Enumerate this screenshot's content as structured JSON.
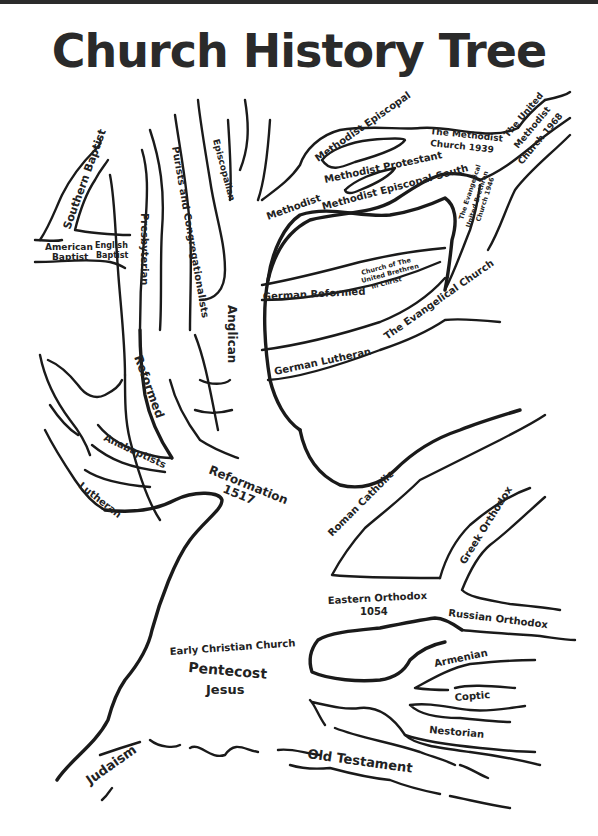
{
  "title": "Church History Tree",
  "colors": {
    "ink": "#1a1a1a",
    "text": "#222222",
    "background": "#ffffff"
  },
  "labels": {
    "southern_baptist": "Southern Baptist",
    "american_baptist_1": "American",
    "american_baptist_2": "Baptist",
    "english_baptist_1": "English",
    "english_baptist_2": "Baptist",
    "presbyterian": "Presbyterian",
    "purists": "Purists and Congregationalists",
    "episcopalian": "Episcopalian",
    "methodist": "Methodist",
    "methodist_episcopal": "Methodist Episcopal",
    "methodist_protestant": "Methodist Protestant",
    "methodist_episcopal_south": "Methodist Episcopal-South",
    "methodist_church_1": "The Methodist",
    "methodist_church_2": "Church 1939",
    "united_methodist_1": "The United",
    "united_methodist_2": "Methodist",
    "united_methodist_3": "Church 1968",
    "evangelical_ub_1": "The Evangelical",
    "evangelical_ub_2": "United Brethren",
    "evangelical_ub_3": "Church 1946",
    "german_reformed": "German Reformed",
    "united_brethren_1": "Church of The",
    "united_brethren_2": "United Brethren",
    "united_brethren_3": "In Christ",
    "evangelical_church": "The Evangelical Church",
    "german_lutheran": "German Lutheran",
    "anglican": "Anglican",
    "reformed": "Reformed",
    "anabaptists": "Anabaptists",
    "lutheran": "Lutheran",
    "reformation_1": "Reformation",
    "reformation_2": "1517",
    "roman_catholic": "Roman Catholic",
    "greek_orthodox": "Greek Orthodox",
    "eastern_orthodox_1": "Eastern Orthodox",
    "eastern_orthodox_2": "1054",
    "russian_orthodox": "Russian Orthodox",
    "armenian": "Armenian",
    "coptic": "Coptic",
    "nestorian": "Nestorian",
    "early_christian_church": "Early Christian Church",
    "pentecost": "Pentecost",
    "jesus": "Jesus",
    "judaism": "Judaism",
    "old_testament": "Old Testament"
  }
}
